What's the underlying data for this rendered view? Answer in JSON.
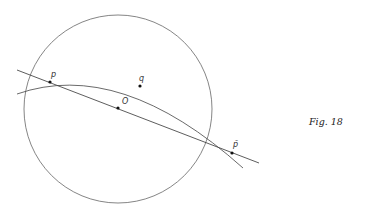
{
  "figure": {
    "caption": "Fig. 18",
    "circle": {
      "cx": 118,
      "cy": 109,
      "r": 94,
      "stroke": "#666666"
    },
    "line": {
      "x1": 17,
      "y1": 70,
      "x2": 259,
      "y2": 163,
      "stroke": "#333333"
    },
    "arc": {
      "path": "M 17 94 Q 120 58 243 168",
      "stroke": "#444444"
    },
    "points": [
      {
        "id": "p",
        "label": "p",
        "x": 50,
        "y": 82,
        "label_dx": 1,
        "label_dy": -5
      },
      {
        "id": "q",
        "label": "q",
        "x": 140,
        "y": 86,
        "label_dx": -1,
        "label_dy": -5
      },
      {
        "id": "O",
        "label": "O",
        "x": 118,
        "y": 108,
        "label_dx": 4,
        "label_dy": -4
      },
      {
        "id": "p-bar",
        "label": "p̄",
        "x": 232,
        "y": 153,
        "label_dx": 1,
        "label_dy": -6
      }
    ]
  }
}
